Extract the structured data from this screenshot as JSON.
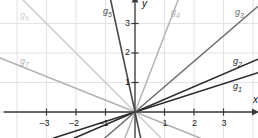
{
  "figure": {
    "kind": "coordinate-plane-line-graph",
    "width": 258,
    "height": 138,
    "background_color": "#ffffff",
    "grid_color": "#e2e2e8",
    "axis_color": "#3a3a3a"
  },
  "axes": {
    "x_axis_label": "x",
    "y_axis_label": "y",
    "x_ticks": [
      "-3",
      "-2",
      "-1",
      "1",
      "2",
      "3"
    ],
    "y_ticks": [
      "1",
      "2",
      "3"
    ],
    "x_range": [
      -4.45,
      4.1
    ],
    "y_range": [
      -0.9,
      3.85
    ],
    "origin_px": [
      135,
      112
    ],
    "unit_px": 29.5,
    "grid": true
  },
  "chart_data": {
    "type": "line",
    "title": "",
    "xlabel": "x",
    "ylabel": "y",
    "xlim": [
      -4.45,
      4.1
    ],
    "ylim": [
      -0.9,
      3.85
    ],
    "grid": true,
    "legend": "inline-labels",
    "note": "Seven straight lines all passing through the origin; each labelled g1..g7 near its end.",
    "series": [
      {
        "name": "g₁",
        "label": "g",
        "subscript": "1",
        "slope": 0.32,
        "intercept": 0,
        "color": "#2b2b2b",
        "width": 1.6,
        "label_pos_px": [
          233,
          82
        ]
      },
      {
        "name": "g₂",
        "label": "g",
        "subscript": "2",
        "slope": 0.43,
        "intercept": 0,
        "color": "#2b2b2b",
        "width": 1.6,
        "label_pos_px": [
          233,
          57
        ]
      },
      {
        "name": "g₃",
        "label": "g",
        "subscript": "3",
        "slope": 0.86,
        "intercept": 0,
        "color": "#6e6e6e",
        "width": 1.5,
        "label_pos_px": [
          235,
          8
        ]
      },
      {
        "name": "g₄",
        "label": "g",
        "subscript": "4",
        "slope": 2.6,
        "intercept": 0,
        "color": "#b4b4b4",
        "width": 1.5,
        "label_pos_px": [
          171,
          8
        ]
      },
      {
        "name": "g₅",
        "label": "g",
        "subscript": "5",
        "slope": -4.6,
        "intercept": 0,
        "color": "#4a4a4a",
        "width": 1.6,
        "label_pos_px": [
          103,
          7
        ]
      },
      {
        "name": "g₆",
        "label": "g",
        "subscript": "6",
        "slope": -1.0,
        "intercept": 0,
        "color": "#cfcfcf",
        "width": 1.5,
        "label_pos_px": [
          20,
          11
        ]
      },
      {
        "name": "g₇",
        "label": "g",
        "subscript": "7",
        "slope": -0.4,
        "intercept": 0,
        "color": "#b0b0b0",
        "width": 1.5,
        "label_pos_px": [
          20,
          57
        ]
      }
    ]
  }
}
